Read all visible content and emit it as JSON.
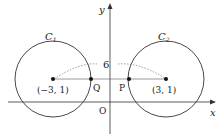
{
  "axes": {
    "x_label": "x",
    "y_label": "y",
    "origin_label": "O"
  },
  "circles": [
    {
      "label": "C",
      "subscript": "1",
      "center_label": "(−3, 1)"
    },
    {
      "label": "C",
      "subscript": "2",
      "center_label": "(3, 1)"
    }
  ],
  "points": {
    "Q": "Q",
    "P": "P"
  },
  "distance_label": "6"
}
